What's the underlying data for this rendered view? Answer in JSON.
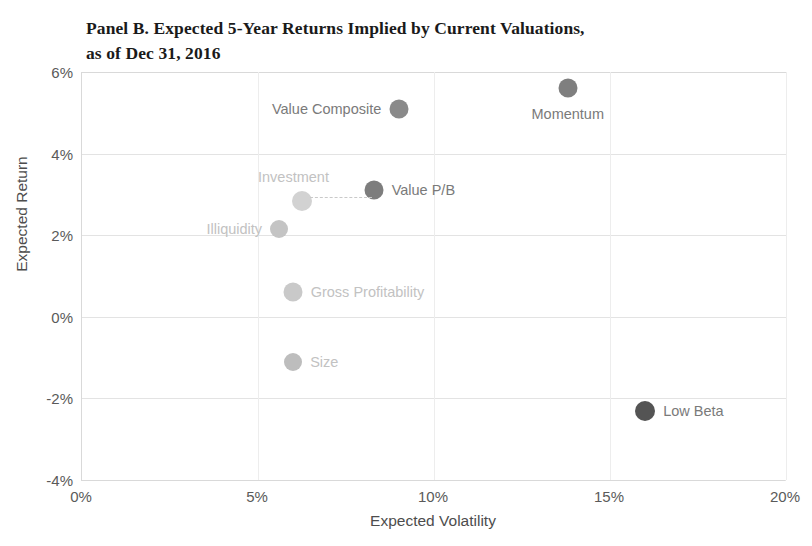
{
  "chart_data": {
    "type": "scatter",
    "title": "Panel B. Expected 5-Year Returns Implied by Current Valuations,\nas of Dec 31, 2016",
    "xlabel": "Expected Volatility",
    "ylabel": "Expected Return",
    "xlim": [
      0,
      20
    ],
    "ylim": [
      -4,
      6
    ],
    "xticks": [
      "0%",
      "5%",
      "10%",
      "15%",
      "20%"
    ],
    "xtick_values": [
      0,
      5,
      10,
      15,
      20
    ],
    "yticks": [
      "6%",
      "4%",
      "2%",
      "0%",
      "-2%",
      "-4%"
    ],
    "ytick_values": [
      6,
      4,
      2,
      0,
      -2,
      -4
    ],
    "grid": "horizontal and vertical, light gray",
    "legend": "none (points labeled directly)",
    "points": [
      {
        "label": "Momentum",
        "x": 13.8,
        "y": 5.6,
        "color": "#7f7f7f",
        "r": 9.5,
        "label_pos": "below"
      },
      {
        "label": "Value Composite",
        "x": 9.0,
        "y": 5.1,
        "color": "#8a8a8a",
        "r": 9.5,
        "label_pos": "left"
      },
      {
        "label": "Value P/B",
        "x": 8.3,
        "y": 3.1,
        "color": "#7d7d7d",
        "r": 9.5,
        "label_pos": "right"
      },
      {
        "label": "Investment",
        "x": 6.25,
        "y": 2.85,
        "color": "#d2d2d2",
        "r": 10.0,
        "label_pos": "above-left"
      },
      {
        "label": "Illiquidity",
        "x": 5.6,
        "y": 2.15,
        "color": "#c4c4c4",
        "r": 9.0,
        "label_pos": "left"
      },
      {
        "label": "Gross Profitability",
        "x": 6.0,
        "y": 0.6,
        "color": "#c9c9c9",
        "r": 9.5,
        "label_pos": "right"
      },
      {
        "label": "Size",
        "x": 6.0,
        "y": -1.1,
        "color": "#bdbdbd",
        "r": 9.0,
        "label_pos": "right"
      },
      {
        "label": "Low Beta",
        "x": 16.0,
        "y": -2.3,
        "color": "#545454",
        "r": 10.0,
        "label_pos": "right"
      }
    ],
    "colors": {
      "axis": "#d9d9d9",
      "gridline": "#e3e3e3",
      "tick_text": "#5a5a5a",
      "title_text": "#1a1a1a",
      "label_text_dark": "#7a7a7a",
      "label_text_light": "#c2c2c2"
    }
  }
}
